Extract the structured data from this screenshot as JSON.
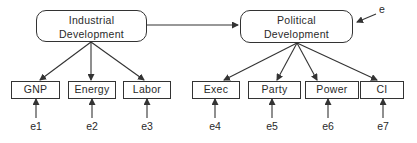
{
  "diagram": {
    "latent_variables": [
      {
        "id": "ind",
        "line1": "Industrial",
        "line2": "Development"
      },
      {
        "id": "pol",
        "line1": "Political",
        "line2": "Development"
      }
    ],
    "disturbance": {
      "label": "e",
      "target": "pol"
    },
    "indicators": [
      {
        "label": "GNP",
        "factor": "ind",
        "error": "e1"
      },
      {
        "label": "Energy",
        "factor": "ind",
        "error": "e2"
      },
      {
        "label": "Labor",
        "factor": "ind",
        "error": "e3"
      },
      {
        "label": "Exec",
        "factor": "pol",
        "error": "e4"
      },
      {
        "label": "Party",
        "factor": "pol",
        "error": "e5"
      },
      {
        "label": "Power",
        "factor": "pol",
        "error": "e6"
      },
      {
        "label": "CI",
        "factor": "pol",
        "error": "e7"
      }
    ],
    "paths": [
      {
        "from": "ind",
        "to": "pol"
      }
    ],
    "colors": {
      "stroke": "#333333",
      "background": "#ffffff"
    }
  }
}
